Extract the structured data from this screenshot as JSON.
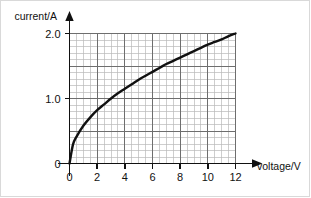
{
  "figure": {
    "background_color": "#ffffff",
    "border_color": "#d9d9d9"
  },
  "chart_data": {
    "type": "line",
    "title": "",
    "subtitle": "",
    "xlabel": "voltage/V",
    "ylabel": "current/A",
    "xlim": [
      0,
      12
    ],
    "ylim": [
      0,
      2.0
    ],
    "xticks": [
      0,
      2,
      4,
      6,
      8,
      10,
      12
    ],
    "xtick_labels": [
      "0",
      "2",
      "4",
      "6",
      "8",
      "10",
      "12"
    ],
    "yticks": [
      0,
      1.0,
      2.0
    ],
    "ytick_labels": [
      "0",
      "1.0",
      "2.0"
    ],
    "grid": true,
    "grid_minor_step_x": 0.5,
    "grid_minor_step_y": 0.1,
    "grid_major_step_x": 2,
    "grid_major_step_y": 0.5,
    "grid_color_minor": "#b9b9b9",
    "grid_color_major": "#6e6e6e",
    "axis_color": "#111111",
    "legend": null,
    "legend_position": "none",
    "annotations": [],
    "series": [
      {
        "name": "current vs voltage",
        "color": "#111111",
        "line_width": 2.4,
        "x": [
          0,
          0.25,
          0.5,
          1,
          1.5,
          2,
          2.5,
          3,
          3.5,
          4,
          4.5,
          5,
          5.5,
          6,
          6.5,
          7,
          7.5,
          8,
          8.5,
          9,
          9.5,
          10,
          10.5,
          11,
          11.5,
          12
        ],
        "values": [
          0,
          0.29,
          0.41,
          0.58,
          0.71,
          0.82,
          0.91,
          1.0,
          1.08,
          1.15,
          1.22,
          1.29,
          1.35,
          1.41,
          1.47,
          1.53,
          1.58,
          1.63,
          1.68,
          1.73,
          1.78,
          1.83,
          1.87,
          1.91,
          1.96,
          2.0
        ]
      }
    ]
  },
  "axis_titles": {
    "y": "current/A",
    "x": "voltage/V"
  }
}
